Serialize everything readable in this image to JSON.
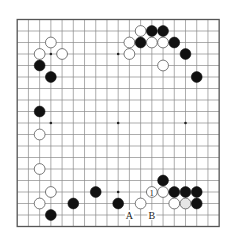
{
  "board": {
    "size": 19,
    "origin_x": 17.2,
    "origin_y": 19.5,
    "spacing_x": 11.22,
    "spacing_y": 11.5,
    "stone_radius": 5.4,
    "star_points": [
      [
        3,
        3
      ],
      [
        9,
        3
      ],
      [
        15,
        3
      ],
      [
        3,
        9
      ],
      [
        9,
        9
      ],
      [
        15,
        9
      ],
      [
        3,
        15
      ],
      [
        9,
        15
      ],
      [
        15,
        15
      ]
    ],
    "colors": {
      "black_stone": "#111111",
      "white_stone": "#ffffff",
      "grid": "#8a8a8a",
      "background": "#ffffff"
    }
  },
  "stones": [
    {
      "color": "white",
      "col": 11,
      "row": 1
    },
    {
      "color": "black",
      "col": 12,
      "row": 1
    },
    {
      "color": "black",
      "col": 13,
      "row": 1
    },
    {
      "color": "white",
      "col": 3,
      "row": 2
    },
    {
      "color": "white",
      "col": 10,
      "row": 2
    },
    {
      "color": "black",
      "col": 11,
      "row": 2
    },
    {
      "color": "white",
      "col": 12,
      "row": 2
    },
    {
      "color": "white",
      "col": 13,
      "row": 2
    },
    {
      "color": "black",
      "col": 14,
      "row": 2
    },
    {
      "color": "white",
      "col": 2,
      "row": 3
    },
    {
      "color": "white",
      "col": 4,
      "row": 3
    },
    {
      "color": "white",
      "col": 10,
      "row": 3
    },
    {
      "color": "black",
      "col": 15,
      "row": 3
    },
    {
      "color": "black",
      "col": 2,
      "row": 4
    },
    {
      "color": "white",
      "col": 13,
      "row": 4
    },
    {
      "color": "black",
      "col": 3,
      "row": 5
    },
    {
      "color": "black",
      "col": 16,
      "row": 5
    },
    {
      "color": "black",
      "col": 2,
      "row": 8
    },
    {
      "color": "white",
      "col": 2,
      "row": 10
    },
    {
      "color": "white",
      "col": 2,
      "row": 13
    },
    {
      "color": "black",
      "col": 13,
      "row": 14
    },
    {
      "color": "white",
      "col": 3,
      "row": 15
    },
    {
      "color": "black",
      "col": 7,
      "row": 15
    },
    {
      "color": "white",
      "col": 12,
      "row": 15,
      "label": "1"
    },
    {
      "color": "white",
      "col": 13,
      "row": 15
    },
    {
      "color": "black",
      "col": 14,
      "row": 15
    },
    {
      "color": "black",
      "col": 15,
      "row": 15
    },
    {
      "color": "black",
      "col": 16,
      "row": 15
    },
    {
      "color": "white",
      "col": 2,
      "row": 16
    },
    {
      "color": "black",
      "col": 5,
      "row": 16
    },
    {
      "color": "black",
      "col": 9,
      "row": 16
    },
    {
      "color": "white",
      "col": 11,
      "row": 16
    },
    {
      "color": "white",
      "col": 14,
      "row": 16
    },
    {
      "color": "white",
      "col": 15,
      "row": 16,
      "shade": "gray"
    },
    {
      "color": "black",
      "col": 16,
      "row": 16
    },
    {
      "color": "black",
      "col": 3,
      "row": 17
    }
  ],
  "marks": [
    {
      "label": "A",
      "col": 10,
      "row": 17
    },
    {
      "label": "B",
      "col": 12,
      "row": 17
    }
  ]
}
